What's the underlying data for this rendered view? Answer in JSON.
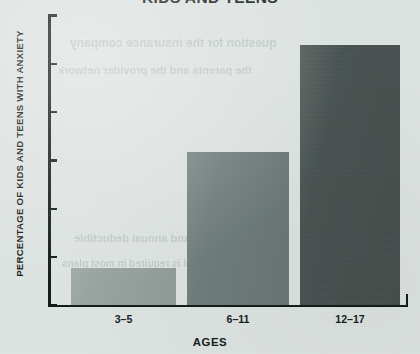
{
  "chart_data": {
    "type": "bar",
    "title": "KIDS AND TEENS",
    "xlabel": "AGES",
    "ylabel": "PERCENTAGE OF KIDS AND TEENS WITH ANXIETY",
    "categories": [
      "3–5",
      "6–11",
      "12–17"
    ],
    "values": [
      1.55,
      6.35,
      10.8
    ],
    "ylim": [
      0,
      12
    ],
    "yticks": [
      0,
      2,
      4,
      6,
      8,
      10,
      12
    ],
    "ytick_labels": [
      "0",
      "2",
      "4",
      "6",
      "8",
      "10",
      "12"
    ],
    "grid": false,
    "legend": "none",
    "bar_colors": [
      "#97a3a0",
      "#6d7b7a",
      "#47514f"
    ],
    "background_color": "#dde3e1",
    "axis_color": "#11181a"
  },
  "page": {
    "title_note": "title cropped at top edge of image",
    "bleed_text": [
      "question for the insurance company",
      "the parents and the provider network",
      "coverage limits and annual deductible",
      "a referral is required in most plans"
    ]
  }
}
